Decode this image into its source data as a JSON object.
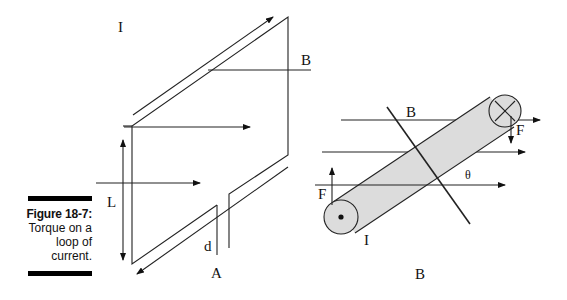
{
  "caption": {
    "figure_number": "Figure 18-7:",
    "lines": [
      "Torque on a",
      "loop of",
      "current."
    ]
  },
  "diagram_a": {
    "panel_label": "A",
    "current_label": "I",
    "field_label": "B",
    "length_label": "L",
    "width_label": "d"
  },
  "diagram_b": {
    "panel_label": "B",
    "field_label": "B",
    "current_label": "I",
    "force_top_label": "F",
    "force_bottom_label": "F",
    "angle_label": "θ",
    "colors": {
      "cylinder_fill": "#dcdcdc",
      "line": "#111111"
    }
  }
}
